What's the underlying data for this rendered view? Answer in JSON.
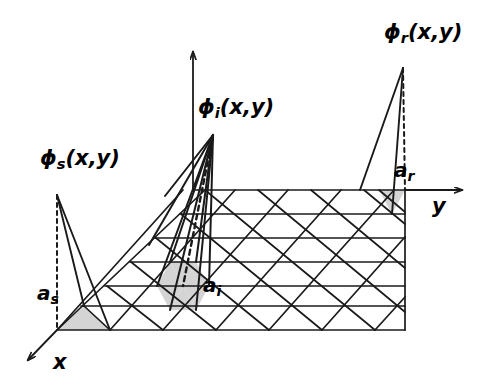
{
  "figure": {
    "type": "diagram",
    "background": "#ffffff",
    "line_color": "#1a1a1a",
    "shade_color": "#d4d4d4"
  },
  "axes": {
    "x": {
      "label": "x",
      "glyph": "x",
      "direction": "down-left",
      "arrow": true
    },
    "y": {
      "label": "y",
      "glyph": "y",
      "direction": "right",
      "arrow": true
    },
    "z": {
      "label": "",
      "direction": "up",
      "arrow": true
    }
  },
  "basis_functions": [
    {
      "id": "phi_s",
      "base": "ϕ",
      "sub": "s",
      "args": "(x,y)",
      "label": "ϕ",
      "node_label": "a",
      "node_sub": "s",
      "peak_value": 1,
      "position": "left-front-corner"
    },
    {
      "id": "phi_i",
      "base": "ϕ",
      "sub": "i",
      "args": "(x,y)",
      "label": "ϕ",
      "node_label": "a",
      "node_sub": "i",
      "peak_value": 1,
      "position": "interior"
    },
    {
      "id": "phi_r",
      "base": "ϕ",
      "sub": "r",
      "args": "(x,y)",
      "label": "ϕ",
      "node_label": "a",
      "node_sub": "r",
      "peak_value": 1,
      "position": "right-back-edge"
    }
  ],
  "labels": {
    "phi_s": "ϕ",
    "phi_s_sub": "s",
    "phi_s_args": "(x,y)",
    "phi_i": "ϕ",
    "phi_i_sub": "i",
    "phi_i_args": "(x,y)",
    "phi_r": "ϕ",
    "phi_r_sub": "r",
    "phi_r_args": "(x,y)",
    "a_s": "a",
    "a_s_sub": "s",
    "a_i": "a",
    "a_i_sub": "i",
    "a_r": "a",
    "a_r_sub": "r",
    "x_axis": "x",
    "y_axis": "y"
  },
  "mesh": {
    "shape": "parallelogram",
    "rows": 6,
    "cols": 7,
    "triangulation": "criss-cross",
    "shaded_patches": [
      {
        "at": "a_s",
        "triangles": 1,
        "note": "support corner triangle"
      },
      {
        "at": "a_i",
        "triangles": 6,
        "note": "hexagonal support of interior node"
      },
      {
        "at": "a_r",
        "triangles": 1,
        "note": "support edge triangle"
      }
    ]
  }
}
